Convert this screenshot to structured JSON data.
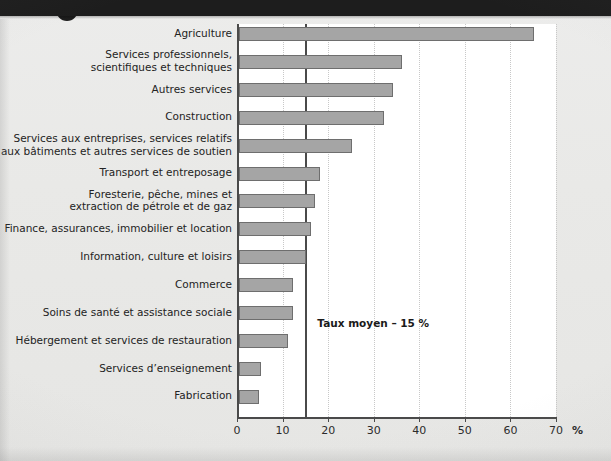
{
  "banner": {
    "name": "top-dark-banner"
  },
  "chart_data": {
    "type": "bar",
    "orientation": "horizontal",
    "title": "",
    "subtitle": "",
    "xlabel": "%",
    "ylabel": "",
    "xlim": [
      0,
      70
    ],
    "xticks": [
      0,
      10,
      20,
      30,
      40,
      50,
      60,
      70
    ],
    "xtick_labels": [
      "0",
      "10",
      "20",
      "30",
      "40",
      "50",
      "60",
      "70"
    ],
    "grid": true,
    "grid_axis": "x",
    "legend": null,
    "bar_color": "#a5a5a5",
    "bar_edge_color": "#6e6e6e",
    "axis_color": "#4a4a4a",
    "plot_background": "#ffffff",
    "page_background": "#e8e8e6",
    "categories": [
      "Agriculture",
      "Services professionnels,\nscientifiques et techniques",
      "Autres services",
      "Construction",
      "Services aux entreprises, services relatifs\naux bâtiments et autres services de soutien",
      "Transport et entreposage",
      "Foresterie, pêche, mines et\nextraction de pétrole et de gaz",
      "Finance, assurances, immobilier et location",
      "Information, culture et loisirs",
      "Commerce",
      "Soins de santé et assistance sociale",
      "Hébergement et services de restauration",
      "Services d’enseignement",
      "Fabrication"
    ],
    "values": [
      65,
      36,
      34,
      32,
      25,
      18,
      17,
      16,
      15,
      12,
      12,
      11,
      5,
      4.5
    ],
    "annotations": [
      {
        "name": "mean-line-label",
        "text": "Taux moyen – 15 %",
        "value": 15,
        "type": "vertical-reference-line"
      }
    ]
  }
}
